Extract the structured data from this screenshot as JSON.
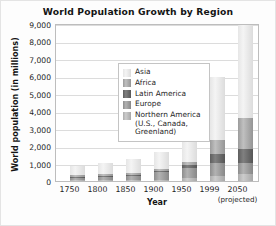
{
  "chart_data": {
    "type": "bar",
    "subtype": "stacked-bar",
    "title": "World Population Growth by Region",
    "xlabel": "Year",
    "ylabel": "World population (in millions)",
    "categories": [
      "1750",
      "1800",
      "1850",
      "1900",
      "1950",
      "1999",
      "2050"
    ],
    "category_sublabels": [
      "",
      "",
      "",
      "",
      "",
      "",
      "(projected)"
    ],
    "ylim": [
      0,
      9000
    ],
    "ytick_values": [
      0,
      1000,
      2000,
      3000,
      4000,
      5000,
      6000,
      7000,
      8000,
      9000
    ],
    "ytick_labels": [
      "0",
      "1,000",
      "2,000",
      "3,000",
      "4,000",
      "5,000",
      "6,000",
      "7,000",
      "8,000",
      "9,000"
    ],
    "grid": true,
    "grid_axis": "y",
    "legend_position": "upper-left-inside",
    "stack_order_bottom_to_top": [
      "Northern America",
      "Europe",
      "Latin America",
      "Africa",
      "Asia"
    ],
    "series": [
      {
        "name": "Northern America",
        "legend_label": "Northern America",
        "legend_label_continued": "(U.S., Canada,",
        "legend_label_continued2": "Greenland)",
        "color": "#b5b5b5",
        "values": [
          2,
          7,
          26,
          82,
          172,
          307,
          392
        ]
      },
      {
        "name": "Europe",
        "legend_label": "Europe",
        "color": "#949494",
        "values": [
          163,
          203,
          276,
          408,
          547,
          729,
          628
        ]
      },
      {
        "name": "Latin America",
        "legend_label": "Latin America",
        "color": "#5e5e5e",
        "values": [
          16,
          24,
          38,
          74,
          167,
          511,
          809
        ]
      },
      {
        "name": "Africa",
        "legend_label": "Africa",
        "color": "#a8a8a8",
        "values": [
          106,
          107,
          111,
          133,
          221,
          767,
          1766
        ]
      },
      {
        "name": "Asia",
        "legend_label": "Asia",
        "color": "#eaeaea",
        "values": [
          502,
          635,
          809,
          947,
          1402,
          3634,
          5268
        ]
      }
    ],
    "totals": [
      789,
      976,
      1260,
      1644,
      2509,
      5948,
      8863
    ]
  }
}
